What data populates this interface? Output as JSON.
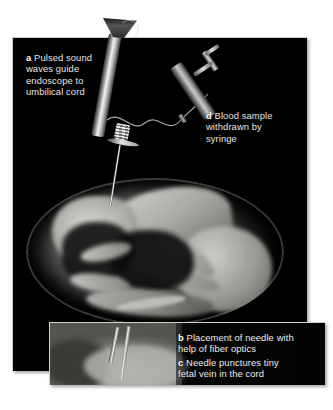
{
  "figure": {
    "background_color": "#ffffff"
  },
  "main_panel": {
    "name": "main-illustration-panel",
    "background_color": "#000000",
    "captions": [
      {
        "id": "a",
        "marker": "a",
        "text": "Pulsed sound\nwaves guide\nendoscope to\numbilical cord"
      },
      {
        "id": "d",
        "marker": "d",
        "text": "Blood sample\nwithdrawn by\nsyringe"
      }
    ],
    "objects": [
      {
        "name": "endoscope",
        "label": "endoscope with funnel-shaped ultrasound transducer"
      },
      {
        "name": "syringe",
        "label": "syringe with plunger and finger flanges"
      },
      {
        "name": "connecting-tube",
        "label": "wavy flexible tube linking endoscope to syringe"
      },
      {
        "name": "needle",
        "label": "long needle entering the amniotic sac"
      },
      {
        "name": "amniotic-sac",
        "label": "amniotic sac containing fetus"
      },
      {
        "name": "fetus",
        "label": "fetus in curled position"
      }
    ]
  },
  "inset_panel": {
    "name": "inset-photo-panel",
    "photo_label": "endoscopic view of needle and fiber-optic probe in tissue",
    "captions": [
      {
        "id": "b",
        "marker": "b",
        "text": "Placement of needle with\nhelp of fiber optics"
      },
      {
        "id": "c",
        "marker": "c",
        "text": "Needle punctures tiny\nfetal vein in the cord"
      }
    ]
  },
  "colors": {
    "panel_background": "#000000",
    "caption_text": "#e6e6e6",
    "marker_text": "#ffffff",
    "page_background": "#ffffff"
  }
}
